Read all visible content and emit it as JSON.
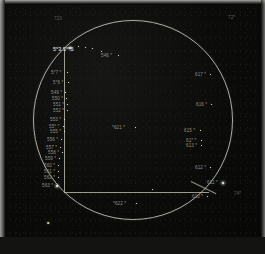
{
  "plate": {
    "title": "Photographic plate star field chart",
    "caption": "",
    "background_color": "#070707",
    "ink_color": "#dcdcd2"
  },
  "corner_labels": [
    {
      "text": "723",
      "x": 48,
      "y": 12,
      "style": "faint"
    },
    {
      "text": "72*",
      "x": 222,
      "y": 11,
      "style": "faint"
    },
    {
      "text": "74*",
      "x": 228,
      "y": 187,
      "style": "faint"
    }
  ],
  "center_labels": [
    {
      "text": "*621 *",
      "x": 106,
      "y": 121,
      "style": "dim"
    },
    {
      "text": "*622 *",
      "x": 107,
      "y": 197,
      "style": "dim"
    }
  ],
  "left_column_labels": [
    {
      "text": "5*3 5**5",
      "x": 47,
      "y": 42,
      "style": "big"
    },
    {
      "text": "546 *",
      "x": 95,
      "y": 49,
      "style": "dim"
    },
    {
      "text": "5*7 *",
      "x": 45,
      "y": 66,
      "style": "dim"
    },
    {
      "text": "5*6 *",
      "x": 47,
      "y": 76,
      "style": "dim"
    },
    {
      "text": "549 *",
      "x": 45,
      "y": 86,
      "style": "dim"
    },
    {
      "text": "550 *",
      "x": 46,
      "y": 92,
      "style": "dim"
    },
    {
      "text": "551 *",
      "x": 47,
      "y": 98,
      "style": "dim"
    },
    {
      "text": "552 *",
      "x": 47,
      "y": 104,
      "style": "dim"
    },
    {
      "text": "553 *",
      "x": 44,
      "y": 113,
      "style": "dim"
    },
    {
      "text": "55* *",
      "x": 43,
      "y": 120,
      "style": "dim"
    },
    {
      "text": "555 *",
      "x": 44,
      "y": 125,
      "style": "dim"
    },
    {
      "text": "556 *",
      "x": 41,
      "y": 133,
      "style": "dim"
    },
    {
      "text": "557 *",
      "x": 40,
      "y": 141,
      "style": "dim"
    },
    {
      "text": "558 *",
      "x": 42,
      "y": 146,
      "style": "dim"
    },
    {
      "text": "559 *",
      "x": 39,
      "y": 152,
      "style": "dim"
    },
    {
      "text": "560 *",
      "x": 38,
      "y": 159,
      "style": "dim"
    },
    {
      "text": "561 *",
      "x": 38,
      "y": 165,
      "style": "dim"
    },
    {
      "text": "562 *",
      "x": 38,
      "y": 171,
      "style": "dim"
    },
    {
      "text": "563 *",
      "x": 36,
      "y": 179,
      "style": "dim"
    }
  ],
  "right_column_labels": [
    {
      "text": "617 *",
      "x": 189,
      "y": 68,
      "style": "dim"
    },
    {
      "text": "616 *",
      "x": 190,
      "y": 98,
      "style": "dim"
    },
    {
      "text": "615 *",
      "x": 178,
      "y": 124,
      "style": "dim"
    },
    {
      "text": "61* *",
      "x": 180,
      "y": 134,
      "style": "dim"
    },
    {
      "text": "613 *",
      "x": 180,
      "y": 139,
      "style": "dim"
    },
    {
      "text": "612 *",
      "x": 189,
      "y": 161,
      "style": "dim"
    },
    {
      "text": "611 *",
      "x": 201,
      "y": 176,
      "style": "dim"
    },
    {
      "text": "610 *",
      "x": 186,
      "y": 190,
      "style": "dim"
    }
  ],
  "plate_marker": {
    "text": "*",
    "x": 41,
    "y": 216
  },
  "stars": [
    {
      "x": 63,
      "y": 42,
      "size": "lg"
    },
    {
      "x": 72,
      "y": 41,
      "size": "sm"
    },
    {
      "x": 79,
      "y": 42,
      "size": "sm"
    },
    {
      "x": 86,
      "y": 43,
      "size": "sm"
    },
    {
      "x": 112,
      "y": 50,
      "size": "sm"
    },
    {
      "x": 61,
      "y": 67,
      "size": "sm"
    },
    {
      "x": 62,
      "y": 77,
      "size": "sm"
    },
    {
      "x": 59,
      "y": 87,
      "size": "sm"
    },
    {
      "x": 60,
      "y": 93,
      "size": "sm"
    },
    {
      "x": 61,
      "y": 99,
      "size": "sm"
    },
    {
      "x": 61,
      "y": 105,
      "size": "sm"
    },
    {
      "x": 58,
      "y": 114,
      "size": "sm"
    },
    {
      "x": 57,
      "y": 121,
      "size": "sm"
    },
    {
      "x": 58,
      "y": 126,
      "size": "sm"
    },
    {
      "x": 55,
      "y": 134,
      "size": "sm"
    },
    {
      "x": 54,
      "y": 142,
      "size": "sm"
    },
    {
      "x": 56,
      "y": 147,
      "size": "sm"
    },
    {
      "x": 53,
      "y": 153,
      "size": "sm"
    },
    {
      "x": 52,
      "y": 160,
      "size": "sm"
    },
    {
      "x": 52,
      "y": 166,
      "size": "sm"
    },
    {
      "x": 52,
      "y": 172,
      "size": "sm"
    },
    {
      "x": 50,
      "y": 180,
      "size": "lg"
    },
    {
      "x": 129,
      "y": 122,
      "size": "sm"
    },
    {
      "x": 130,
      "y": 198,
      "size": "sm"
    },
    {
      "x": 204,
      "y": 69,
      "size": "sm"
    },
    {
      "x": 205,
      "y": 99,
      "size": "sm"
    },
    {
      "x": 194,
      "y": 125,
      "size": "sm"
    },
    {
      "x": 195,
      "y": 135,
      "size": "sm"
    },
    {
      "x": 195,
      "y": 140,
      "size": "sm"
    },
    {
      "x": 204,
      "y": 162,
      "size": "sm"
    },
    {
      "x": 216,
      "y": 177,
      "size": "lg"
    },
    {
      "x": 201,
      "y": 191,
      "size": "sm"
    },
    {
      "x": 146,
      "y": 184,
      "size": "sm"
    },
    {
      "x": 95,
      "y": 46,
      "size": "sm"
    }
  ]
}
